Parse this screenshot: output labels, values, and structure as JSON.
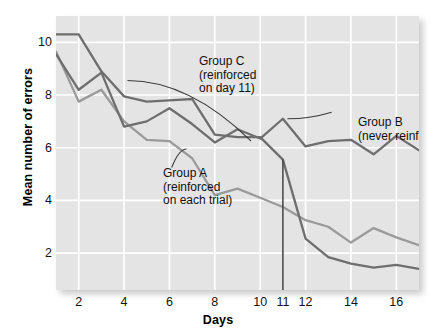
{
  "chart_data": {
    "type": "line",
    "title": "",
    "xlabel": "Days",
    "ylabel": "Mean number of errors",
    "xlim": [
      1,
      17
    ],
    "ylim": [
      0.6,
      11.0
    ],
    "xticks": [
      2,
      4,
      6,
      8,
      10,
      11,
      12,
      14,
      16
    ],
    "yticks": [
      2,
      4,
      6,
      8,
      10
    ],
    "grid": true,
    "legend": "inline-annotations",
    "x": [
      1,
      2,
      3,
      4,
      5,
      6,
      7,
      8,
      9,
      10,
      11,
      12,
      13,
      14,
      15,
      16,
      17
    ],
    "series": [
      {
        "name": "Group A",
        "annotation": "Group A\n(reinforced\non each trial)",
        "color": "#9a9a9a",
        "values": [
          9.65,
          7.75,
          8.2,
          7.0,
          6.3,
          6.25,
          5.6,
          4.2,
          4.45,
          4.1,
          3.75,
          3.25,
          3.0,
          2.4,
          2.95,
          2.6,
          2.3
        ]
      },
      {
        "name": "Group B",
        "annotation": "Group B\n(never reinforced)",
        "color": "#6e6e6e",
        "values": [
          9.55,
          8.2,
          8.85,
          6.8,
          7.0,
          7.5,
          6.9,
          6.2,
          6.7,
          6.35,
          7.1,
          6.05,
          6.25,
          6.3,
          5.75,
          6.45,
          5.9
        ]
      },
      {
        "name": "Group C",
        "annotation": "Group C\n(reinforced\non day 11)",
        "color": "#6e6e6e",
        "values": [
          10.3,
          10.3,
          8.9,
          7.95,
          7.75,
          7.8,
          7.85,
          6.5,
          6.4,
          6.4,
          5.55,
          2.55,
          1.85,
          1.6,
          1.45,
          1.55,
          1.4
        ]
      }
    ],
    "reference_line": {
      "name": "day-11-marker",
      "x": 11,
      "y_from": 5.55,
      "y_to": 0.6
    },
    "annotation_leaders": [
      {
        "for": "Group C",
        "from": [
          9.6,
          6.25
        ],
        "to": [
          4.15,
          8.55
        ]
      },
      {
        "for": "Group B",
        "from": [
          13.15,
          7.35
        ],
        "to": [
          11.2,
          7.1
        ]
      },
      {
        "for": "Group A",
        "from": [
          6.1,
          5.25
        ],
        "to": [
          6.75,
          5.95
        ]
      }
    ]
  },
  "axes": {
    "xlabel": "Days",
    "ylabel": "Mean number of errors",
    "xticklabels": [
      "2",
      "4",
      "6",
      "8",
      "10",
      "11",
      "12",
      "14",
      "16"
    ],
    "yticklabels": [
      "10",
      "8",
      "6",
      "4",
      "2"
    ]
  },
  "annotations": {
    "group_c": "Group C\n(reinforced\non day 11)",
    "group_b": "Group B\n(never reinforced)",
    "group_a": "Group A\n(reinforced\non each trial)"
  },
  "colors": {
    "plot_background": "#e4e4e4",
    "gridline": "#ffffff",
    "series_dark": "#6e6e6e",
    "series_light": "#9a9a9a",
    "text": "#111111"
  }
}
